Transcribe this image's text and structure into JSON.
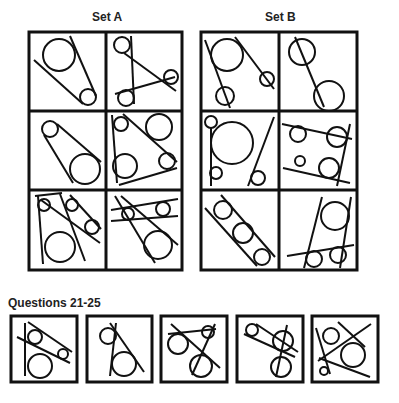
{
  "set_a": {
    "title": "Set A"
  },
  "set_b": {
    "title": "Set B"
  },
  "questions": {
    "title": "Questions 21-25",
    "items": [
      "21",
      "22",
      "23",
      "24",
      "25"
    ]
  },
  "colors": {
    "ink": "#111111",
    "background": "#ffffff"
  }
}
